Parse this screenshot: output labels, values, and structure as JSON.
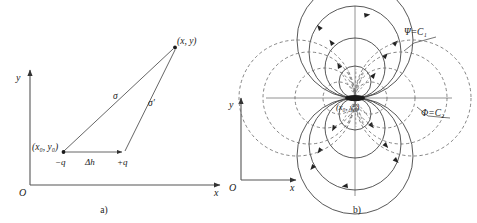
{
  "figure": {
    "width": 477,
    "height": 223,
    "background": "#ffffff",
    "ink": "#1a1a1a",
    "line_color": "#555555"
  },
  "panel_a": {
    "caption": "a)",
    "axis_y_label": "y",
    "axis_x_label": "x",
    "origin_label": "O",
    "field_point_label": "(x, y)",
    "source_point_label": "(x₀, y₀)",
    "negative_charge_label": "−q",
    "positive_charge_label": "+q",
    "separation_label": "Δh",
    "distance_label": "σ",
    "distance_prime_label": "σ′",
    "geometry": {
      "y_axis_x": 30,
      "x_axis_y": 185,
      "x_axis_end": 222,
      "y_axis_top": 68,
      "neg_charge": [
        63,
        152
      ],
      "pos_charge": [
        124,
        152
      ],
      "field_point": [
        175,
        47
      ]
    }
  },
  "panel_b": {
    "caption": "b)",
    "axis_y_label": "y",
    "axis_x_label": "x",
    "origin_label": "O",
    "dipole_label": "(x₀, y₀)",
    "streamline_label": "Ψ=C₁",
    "equipotential_label": "Φ=C₂",
    "geometry": {
      "frame_y_axis_x": 241,
      "frame_x_axis_y": 180,
      "frame_x_axis_end": 298,
      "frame_y_axis_top": 96,
      "dipole_center": [
        355,
        98
      ],
      "plot_v_axis_top": 6,
      "plot_v_axis_bottom": 196,
      "plot_h_axis_left": 266,
      "plot_h_axis_right": 452
    },
    "streamline_radii": [
      16,
      30,
      46,
      58
    ],
    "equipotential_radii": [
      16,
      30,
      46,
      58
    ],
    "leader_streamline": [
      [
        438,
        37
      ],
      [
        404,
        51
      ]
    ],
    "leader_equipotential": [
      [
        452,
        118
      ],
      [
        417,
        107
      ]
    ]
  }
}
